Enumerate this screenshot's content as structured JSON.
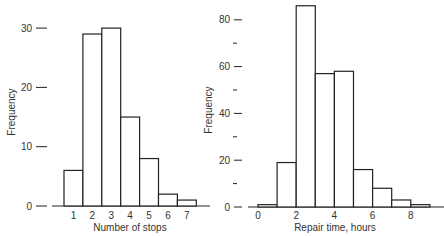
{
  "chart_data": [
    {
      "type": "bar",
      "title": "",
      "xlabel": "Number of stops",
      "ylabel": "Frequency",
      "categories": [
        "1",
        "2",
        "3",
        "4",
        "5",
        "6",
        "7"
      ],
      "values": [
        6,
        29,
        30,
        15,
        8,
        2,
        1
      ],
      "yticks": [
        0,
        10,
        20,
        30
      ],
      "xticks": [
        "1",
        "2",
        "3",
        "4",
        "5",
        "6",
        "7"
      ],
      "ylim": [
        0,
        30
      ],
      "grid": false,
      "legend": null
    },
    {
      "type": "bar",
      "title": "",
      "xlabel": "Repair time, hours",
      "ylabel": "Frequency",
      "bins": [
        [
          0,
          1
        ],
        [
          1,
          2
        ],
        [
          2,
          3
        ],
        [
          3,
          4
        ],
        [
          4,
          5
        ],
        [
          5,
          6
        ],
        [
          6,
          7
        ],
        [
          7,
          8
        ],
        [
          8,
          9
        ]
      ],
      "values": [
        1,
        19,
        86,
        57,
        58,
        16,
        8,
        3,
        1
      ],
      "yticks": [
        0,
        20,
        40,
        60,
        80
      ],
      "yminor_ticks": [
        10,
        30,
        50,
        70
      ],
      "xticks": [
        "0",
        "2",
        "4",
        "6",
        "8"
      ],
      "ylim": [
        0,
        80
      ],
      "grid": false,
      "legend": null
    }
  ]
}
